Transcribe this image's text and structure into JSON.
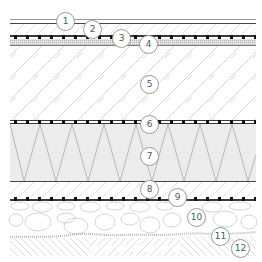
{
  "diagram": {
    "type": "layered-construction-section",
    "colors": {
      "line": "#3a3a3a",
      "hatch": "#bdbdbd",
      "insulation_fill": "#e9e9e9",
      "dotted_band": "#cfcfcf",
      "callout_border": "#9a9a9a",
      "callout_text": "#555555"
    },
    "callouts": [
      {
        "label": "1",
        "x": 56,
        "y": 12
      },
      {
        "label": "2",
        "x": 83,
        "y": 20
      },
      {
        "label": "3",
        "x": 112,
        "y": 29
      },
      {
        "label": "4",
        "x": 139,
        "y": 35
      },
      {
        "label": "5",
        "x": 140,
        "y": 75
      },
      {
        "label": "6",
        "x": 140,
        "y": 115
      },
      {
        "label": "7",
        "x": 140,
        "y": 147
      },
      {
        "label": "8",
        "x": 140,
        "y": 180
      },
      {
        "label": "9",
        "x": 168,
        "y": 188
      },
      {
        "label": "10",
        "x": 187,
        "y": 208
      },
      {
        "label": "11",
        "x": 211,
        "y": 227
      },
      {
        "label": "12",
        "x": 231,
        "y": 239
      }
    ]
  }
}
